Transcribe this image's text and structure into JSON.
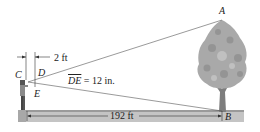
{
  "diagram": {
    "type": "geometry-word-problem",
    "points": {
      "A": "A",
      "B": "B",
      "C": "C",
      "D": "D",
      "E": "E"
    },
    "labels": {
      "horizontal_distance": "2 ft",
      "de_segment": "DE",
      "de_value": " = 12 in.",
      "ground_distance": "192 ft"
    },
    "colors": {
      "line": "#444444",
      "ground": "#b8b8b8",
      "ground_edge": "#8a8a8a",
      "tree_crown": "#a8a8a8",
      "tree_trunk": "#7d7d7d",
      "person": "#5a5a5a"
    }
  }
}
